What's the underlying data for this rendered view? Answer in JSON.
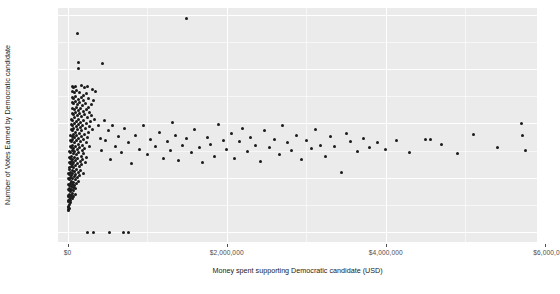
{
  "chart_data": {
    "type": "scatter",
    "title": "",
    "xlabel": "Money spent supporting Democratic candidate (USD)",
    "ylabel": "Number of Votes Earned by Democratic candidate",
    "xlim": [
      -120000,
      5900000
    ],
    "ylim": [
      -18000,
      412000
    ],
    "grid": true,
    "legend": "none",
    "xticks": [
      0,
      2000000,
      4000000,
      6000000
    ],
    "xtick_labels": [
      "$0",
      "$2,000,000",
      "$4,000,000",
      "$6,000,0"
    ],
    "yticks": [
      0,
      100000,
      200000,
      300000,
      400000
    ],
    "ytick_labels": [
      "0 -",
      "100,000 -",
      "200,000 -",
      "300,000 -",
      "400,000 -"
    ],
    "marker": {
      "shape": "circle",
      "color": "#1a1a1a",
      "size": 3
    },
    "panel_background": "#ebebeb",
    "gridline_color": "#ffffff",
    "series": [
      {
        "name": "districts",
        "points": [
          [
            1490000,
            392000
          ],
          [
            128000,
            366000
          ],
          [
            133000,
            312000
          ],
          [
            443000,
            310000
          ],
          [
            133000,
            300000
          ],
          [
            60000,
            268000
          ],
          [
            70000,
            266000
          ],
          [
            96000,
            268000
          ],
          [
            180000,
            270000
          ],
          [
            215000,
            266000
          ],
          [
            250000,
            268000
          ],
          [
            310000,
            262000
          ],
          [
            355000,
            258000
          ],
          [
            62000,
            258000
          ],
          [
            88000,
            256000
          ],
          [
            118000,
            260000
          ],
          [
            148000,
            256000
          ],
          [
            196000,
            252000
          ],
          [
            236000,
            254000
          ],
          [
            60000,
            248000
          ],
          [
            80000,
            246000
          ],
          [
            104000,
            250000
          ],
          [
            140000,
            244000
          ],
          [
            170000,
            248000
          ],
          [
            205000,
            242000
          ],
          [
            268000,
            246000
          ],
          [
            330000,
            242000
          ],
          [
            58000,
            238000
          ],
          [
            78000,
            236000
          ],
          [
            98000,
            240000
          ],
          [
            126000,
            234000
          ],
          [
            152000,
            238000
          ],
          [
            188000,
            232000
          ],
          [
            222000,
            236000
          ],
          [
            262000,
            230000
          ],
          [
            300000,
            234000
          ],
          [
            62000,
            228000
          ],
          [
            84000,
            226000
          ],
          [
            110000,
            230000
          ],
          [
            136000,
            224000
          ],
          [
            164000,
            228000
          ],
          [
            196000,
            222000
          ],
          [
            238000,
            226000
          ],
          [
            276000,
            220000
          ],
          [
            56000,
            218000
          ],
          [
            74000,
            216000
          ],
          [
            94000,
            220000
          ],
          [
            120000,
            214000
          ],
          [
            148000,
            218000
          ],
          [
            178000,
            212000
          ],
          [
            212000,
            216000
          ],
          [
            254000,
            210000
          ],
          [
            296000,
            214000
          ],
          [
            340000,
            208000
          ],
          [
            52000,
            208000
          ],
          [
            68000,
            206000
          ],
          [
            88000,
            210000
          ],
          [
            112000,
            204000
          ],
          [
            140000,
            208000
          ],
          [
            168000,
            202000
          ],
          [
            200000,
            206000
          ],
          [
            240000,
            200000
          ],
          [
            286000,
            204000
          ],
          [
            48000,
            198000
          ],
          [
            66000,
            196000
          ],
          [
            84000,
            200000
          ],
          [
            108000,
            194000
          ],
          [
            132000,
            198000
          ],
          [
            162000,
            192000
          ],
          [
            192000,
            196000
          ],
          [
            228000,
            190000
          ],
          [
            272000,
            194000
          ],
          [
            318000,
            188000
          ],
          [
            44000,
            188000
          ],
          [
            60000,
            186000
          ],
          [
            78000,
            190000
          ],
          [
            100000,
            184000
          ],
          [
            124000,
            188000
          ],
          [
            150000,
            182000
          ],
          [
            180000,
            186000
          ],
          [
            216000,
            180000
          ],
          [
            258000,
            184000
          ],
          [
            40000,
            178000
          ],
          [
            56000,
            176000
          ],
          [
            72000,
            180000
          ],
          [
            92000,
            174000
          ],
          [
            116000,
            178000
          ],
          [
            142000,
            172000
          ],
          [
            172000,
            176000
          ],
          [
            206000,
            170000
          ],
          [
            246000,
            174000
          ],
          [
            36000,
            168000
          ],
          [
            50000,
            166000
          ],
          [
            66000,
            170000
          ],
          [
            86000,
            164000
          ],
          [
            108000,
            168000
          ],
          [
            132000,
            162000
          ],
          [
            160000,
            166000
          ],
          [
            194000,
            160000
          ],
          [
            232000,
            164000
          ],
          [
            280000,
            158000
          ],
          [
            32000,
            158000
          ],
          [
            46000,
            156000
          ],
          [
            60000,
            160000
          ],
          [
            78000,
            154000
          ],
          [
            98000,
            158000
          ],
          [
            122000,
            152000
          ],
          [
            150000,
            156000
          ],
          [
            182000,
            150000
          ],
          [
            218000,
            154000
          ],
          [
            28000,
            148000
          ],
          [
            42000,
            146000
          ],
          [
            56000,
            150000
          ],
          [
            72000,
            144000
          ],
          [
            92000,
            148000
          ],
          [
            114000,
            142000
          ],
          [
            140000,
            146000
          ],
          [
            170000,
            140000
          ],
          [
            204000,
            144000
          ],
          [
            244000,
            138000
          ],
          [
            26000,
            138000
          ],
          [
            38000,
            136000
          ],
          [
            52000,
            140000
          ],
          [
            68000,
            134000
          ],
          [
            86000,
            138000
          ],
          [
            106000,
            132000
          ],
          [
            130000,
            136000
          ],
          [
            158000,
            130000
          ],
          [
            190000,
            134000
          ],
          [
            226000,
            128000
          ],
          [
            22000,
            128000
          ],
          [
            34000,
            126000
          ],
          [
            48000,
            130000
          ],
          [
            62000,
            124000
          ],
          [
            80000,
            128000
          ],
          [
            100000,
            122000
          ],
          [
            122000,
            126000
          ],
          [
            148000,
            120000
          ],
          [
            178000,
            124000
          ],
          [
            20000,
            118000
          ],
          [
            30000,
            116000
          ],
          [
            44000,
            120000
          ],
          [
            58000,
            114000
          ],
          [
            74000,
            118000
          ],
          [
            92000,
            112000
          ],
          [
            114000,
            116000
          ],
          [
            138000,
            110000
          ],
          [
            166000,
            114000
          ],
          [
            200000,
            108000
          ],
          [
            18000,
            108000
          ],
          [
            28000,
            106000
          ],
          [
            40000,
            110000
          ],
          [
            52000,
            104000
          ],
          [
            68000,
            108000
          ],
          [
            84000,
            102000
          ],
          [
            104000,
            106000
          ],
          [
            126000,
            100000
          ],
          [
            152000,
            104000
          ],
          [
            16000,
            98000
          ],
          [
            24000,
            96000
          ],
          [
            36000,
            100000
          ],
          [
            48000,
            94000
          ],
          [
            62000,
            98000
          ],
          [
            78000,
            92000
          ],
          [
            96000,
            96000
          ],
          [
            116000,
            90000
          ],
          [
            140000,
            94000
          ],
          [
            14000,
            88000
          ],
          [
            22000,
            86000
          ],
          [
            32000,
            90000
          ],
          [
            44000,
            84000
          ],
          [
            56000,
            88000
          ],
          [
            70000,
            82000
          ],
          [
            88000,
            86000
          ],
          [
            106000,
            80000
          ],
          [
            12000,
            78000
          ],
          [
            20000,
            76000
          ],
          [
            28000,
            80000
          ],
          [
            38000,
            74000
          ],
          [
            50000,
            78000
          ],
          [
            64000,
            72000
          ],
          [
            80000,
            76000
          ],
          [
            98000,
            70000
          ],
          [
            10000,
            68000
          ],
          [
            18000,
            66000
          ],
          [
            26000,
            70000
          ],
          [
            34000,
            64000
          ],
          [
            46000,
            68000
          ],
          [
            58000,
            62000
          ],
          [
            74000,
            66000
          ],
          [
            9000,
            58000
          ],
          [
            16000,
            56000
          ],
          [
            24000,
            60000
          ],
          [
            32000,
            54000
          ],
          [
            42000,
            58000
          ],
          [
            8000,
            48000
          ],
          [
            15000,
            46000
          ],
          [
            22000,
            50000
          ],
          [
            30000,
            44000
          ],
          [
            7000,
            40000
          ],
          [
            14000,
            42000
          ],
          [
            390000,
            196000
          ],
          [
            412000,
            172000
          ],
          [
            430000,
            150000
          ],
          [
            466000,
            205000
          ],
          [
            480000,
            168000
          ],
          [
            510000,
            186000
          ],
          [
            540000,
            134000
          ],
          [
            570000,
            196000
          ],
          [
            600000,
            158000
          ],
          [
            640000,
            176000
          ],
          [
            680000,
            146000
          ],
          [
            720000,
            190000
          ],
          [
            760000,
            164000
          ],
          [
            800000,
            126000
          ],
          [
            850000,
            178000
          ],
          [
            900000,
            152000
          ],
          [
            950000,
            196000
          ],
          [
            1000000,
            142000
          ],
          [
            1040000,
            170000
          ],
          [
            1100000,
            158000
          ],
          [
            1150000,
            184000
          ],
          [
            1200000,
            136000
          ],
          [
            1250000,
            166000
          ],
          [
            1300000,
            150000
          ],
          [
            1320000,
            202000
          ],
          [
            1360000,
            178000
          ],
          [
            1400000,
            132000
          ],
          [
            1450000,
            160000
          ],
          [
            1500000,
            172000
          ],
          [
            1560000,
            146000
          ],
          [
            1600000,
            188000
          ],
          [
            1660000,
            156000
          ],
          [
            1700000,
            128000
          ],
          [
            1760000,
            174000
          ],
          [
            1800000,
            162000
          ],
          [
            1850000,
            140000
          ],
          [
            1900000,
            198000
          ],
          [
            1960000,
            168000
          ],
          [
            2000000,
            152000
          ],
          [
            2060000,
            182000
          ],
          [
            2100000,
            136000
          ],
          [
            2160000,
            166000
          ],
          [
            2200000,
            190000
          ],
          [
            2260000,
            148000
          ],
          [
            2300000,
            174000
          ],
          [
            2360000,
            160000
          ],
          [
            2420000,
            130000
          ],
          [
            2480000,
            186000
          ],
          [
            2540000,
            156000
          ],
          [
            2600000,
            170000
          ],
          [
            2660000,
            142000
          ],
          [
            2700000,
            196000
          ],
          [
            2760000,
            164000
          ],
          [
            2820000,
            150000
          ],
          [
            2880000,
            178000
          ],
          [
            2940000,
            134000
          ],
          [
            3000000,
            168000
          ],
          [
            3060000,
            154000
          ],
          [
            3120000,
            188000
          ],
          [
            3180000,
            160000
          ],
          [
            3240000,
            140000
          ],
          [
            3300000,
            176000
          ],
          [
            3360000,
            158000
          ],
          [
            3440000,
            110000
          ],
          [
            3500000,
            182000
          ],
          [
            3560000,
            166000
          ],
          [
            3640000,
            148000
          ],
          [
            3720000,
            172000
          ],
          [
            3800000,
            156000
          ],
          [
            3900000,
            164000
          ],
          [
            4000000,
            152000
          ],
          [
            4140000,
            168000
          ],
          [
            4300000,
            146000
          ],
          [
            4500000,
            170000
          ],
          [
            4560000,
            170000
          ],
          [
            4700000,
            162000
          ],
          [
            4900000,
            144000
          ],
          [
            5100000,
            180000
          ],
          [
            5400000,
            156000
          ],
          [
            5700000,
            200000
          ],
          [
            5720000,
            178000
          ],
          [
            5760000,
            150000
          ],
          [
            250000,
            0
          ],
          [
            320000,
            0
          ],
          [
            530000,
            0
          ],
          [
            700000,
            0
          ],
          [
            760000,
            0
          ]
        ]
      }
    ]
  }
}
